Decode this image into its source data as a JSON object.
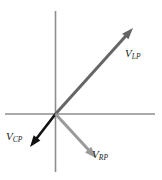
{
  "figure": {
    "name": "vector-diagram",
    "background_color": "#ffffff",
    "width": 162,
    "height": 180
  },
  "axes": {
    "origin": {
      "x": 55.5,
      "y": 114
    },
    "color": "#8e8e8e",
    "stroke_width": 1.6,
    "horizontal": {
      "name": "horizontal-axis",
      "x1": 5,
      "y1": 114,
      "x2": 155,
      "y2": 114
    },
    "vertical": {
      "name": "vertical-axis",
      "x1": 55.5,
      "y1": 11,
      "x2": 55.5,
      "y2": 172
    }
  },
  "vectors": [
    {
      "id": "vlp",
      "name": "vector-vlp",
      "label_base": "V",
      "label_sub": "LP",
      "color": "#666666",
      "stroke_width": 3.0,
      "x1": 55.5,
      "y1": 114,
      "x2": 133,
      "y2": 28,
      "direction": "upper-right",
      "label_x": 125,
      "label_y": 44
    },
    {
      "id": "vcp",
      "name": "vector-vcp",
      "label_base": "V",
      "label_sub": "CP",
      "color": "#111111",
      "stroke_width": 2.6,
      "x1": 55.5,
      "y1": 114,
      "x2": 30,
      "y2": 147,
      "direction": "lower-left",
      "label_x": 6,
      "label_y": 127
    },
    {
      "id": "vrp",
      "name": "vector-vrp",
      "label_base": "V",
      "label_sub": "RP",
      "color": "#9a9a9a",
      "stroke_width": 3.0,
      "x1": 55.5,
      "y1": 114,
      "x2": 96,
      "y2": 158,
      "direction": "lower-right",
      "label_x": 92,
      "label_y": 145
    }
  ]
}
